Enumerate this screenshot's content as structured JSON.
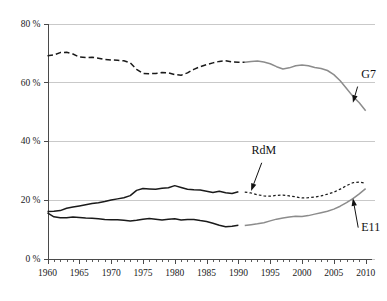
{
  "chart_data": {
    "type": "line",
    "title": "",
    "subtitle": "",
    "xlabel": "",
    "ylabel": "",
    "xlim": [
      1960,
      2011
    ],
    "ylim": [
      0,
      80
    ],
    "grid": "horizontal",
    "legend_position": "inline-annotations",
    "y_ticks": [
      0,
      20,
      40,
      60,
      80
    ],
    "y_tick_labels": [
      "0 %",
      "20 %",
      "40 %",
      "60 %",
      "80 %"
    ],
    "x_ticks": [
      1960,
      1965,
      1970,
      1975,
      1980,
      1985,
      1990,
      1995,
      2000,
      2005,
      2010
    ],
    "x_tick_labels": [
      "1960",
      "1965",
      "1970",
      "1975",
      "1980",
      "1985",
      "1990",
      "1995",
      "2000",
      "2005",
      "2010"
    ],
    "x_minor_tick_step": 1,
    "annotations": [
      {
        "text": "G7",
        "x": 2009,
        "y": 60.5,
        "points_to_x": 2008,
        "points_to_y": 53.0
      },
      {
        "text": "RdM",
        "x": 1994,
        "y": 34.5,
        "points_to_x": 1992,
        "points_to_y": 23.0
      },
      {
        "text": "E11",
        "x": 2009,
        "y": 8.5,
        "points_to_x": 2008,
        "points_to_y": 20.5
      }
    ],
    "series": [
      {
        "name": "G7",
        "segment": "historical",
        "style": "dashed",
        "color": "#1a1a1a",
        "x": [
          1960,
          1961,
          1962,
          1963,
          1964,
          1965,
          1966,
          1967,
          1968,
          1969,
          1970,
          1971,
          1972,
          1973,
          1974,
          1975,
          1976,
          1977,
          1978,
          1979,
          1980,
          1981,
          1982,
          1983,
          1984,
          1985,
          1986,
          1987,
          1988,
          1989,
          1990,
          1991
        ],
        "values": [
          69.0,
          69.3,
          70.1,
          70.2,
          69.6,
          68.6,
          68.4,
          68.5,
          68.2,
          67.8,
          67.6,
          67.5,
          67.3,
          66.6,
          64.4,
          63.0,
          62.9,
          63.0,
          63.3,
          63.2,
          62.6,
          62.4,
          63.2,
          64.4,
          65.3,
          66.0,
          66.6,
          67.1,
          67.3,
          66.9,
          66.8,
          66.8
        ]
      },
      {
        "name": "G7",
        "segment": "recent",
        "style": "solid",
        "color": "#8c8c8c",
        "x": [
          1991,
          1992,
          1993,
          1994,
          1995,
          1996,
          1997,
          1998,
          1999,
          2000,
          2001,
          2002,
          2003,
          2004,
          2005,
          2006,
          2007,
          2008,
          2009,
          2010
        ],
        "values": [
          66.8,
          67.1,
          67.2,
          66.9,
          66.3,
          65.3,
          64.5,
          64.9,
          65.6,
          65.9,
          65.6,
          65.0,
          64.7,
          64.0,
          62.6,
          60.5,
          57.9,
          55.2,
          53.0,
          50.3
        ]
      },
      {
        "name": "RdM",
        "segment": "historical",
        "style": "solid",
        "color": "#1a1a1a",
        "x": [
          1960,
          1961,
          1962,
          1963,
          1964,
          1965,
          1966,
          1967,
          1968,
          1969,
          1970,
          1971,
          1972,
          1973,
          1974,
          1975,
          1976,
          1977,
          1978,
          1979,
          1980,
          1981,
          1982,
          1983,
          1984,
          1985,
          1986,
          1987,
          1988,
          1989,
          1990
        ],
        "values": [
          16.0,
          16.1,
          16.3,
          17.1,
          17.5,
          17.9,
          18.3,
          18.7,
          19.0,
          19.4,
          19.9,
          20.3,
          20.7,
          21.4,
          23.2,
          23.8,
          23.7,
          23.6,
          23.9,
          24.1,
          24.8,
          24.2,
          23.6,
          23.4,
          23.3,
          22.9,
          22.5,
          22.9,
          22.4,
          22.1,
          22.7
        ]
      },
      {
        "name": "RdM",
        "segment": "recent",
        "style": "dashed-fine",
        "color": "#1a1a1a",
        "x": [
          1991,
          1992,
          1993,
          1994,
          1995,
          1996,
          1997,
          1998,
          1999,
          2000,
          2001,
          2002,
          2003,
          2004,
          2005,
          2006,
          2007,
          2008,
          2009,
          2010
        ],
        "values": [
          22.6,
          22.3,
          21.7,
          21.3,
          21.2,
          21.5,
          21.6,
          21.3,
          21.0,
          20.6,
          20.7,
          20.9,
          21.3,
          21.9,
          22.6,
          23.6,
          24.8,
          25.8,
          26.0,
          25.6
        ]
      },
      {
        "name": "E11",
        "segment": "historical",
        "style": "solid",
        "color": "#1a1a1a",
        "x": [
          1960,
          1961,
          1962,
          1963,
          1964,
          1965,
          1966,
          1967,
          1968,
          1969,
          1970,
          1971,
          1972,
          1973,
          1974,
          1975,
          1976,
          1977,
          1978,
          1979,
          1980,
          1981,
          1982,
          1983,
          1984,
          1985,
          1986,
          1987,
          1988,
          1989,
          1990
        ],
        "values": [
          15.5,
          14.2,
          13.9,
          13.9,
          14.1,
          14.0,
          13.8,
          13.7,
          13.5,
          13.3,
          13.2,
          13.2,
          13.0,
          12.8,
          13.0,
          13.4,
          13.6,
          13.4,
          13.1,
          13.4,
          13.5,
          13.1,
          13.3,
          13.3,
          12.9,
          12.6,
          12.0,
          11.3,
          10.8,
          11.0,
          11.3
        ]
      },
      {
        "name": "E11",
        "segment": "recent",
        "style": "solid",
        "color": "#8c8c8c",
        "x": [
          1991,
          1992,
          1993,
          1994,
          1995,
          1996,
          1997,
          1998,
          1999,
          2000,
          2001,
          2002,
          2003,
          2004,
          2005,
          2006,
          2007,
          2008,
          2009,
          2010
        ],
        "values": [
          11.2,
          11.5,
          11.8,
          12.2,
          12.8,
          13.4,
          13.8,
          14.1,
          14.4,
          14.3,
          14.6,
          15.1,
          15.6,
          16.1,
          16.8,
          17.8,
          19.0,
          20.4,
          22.0,
          23.8
        ]
      }
    ]
  }
}
